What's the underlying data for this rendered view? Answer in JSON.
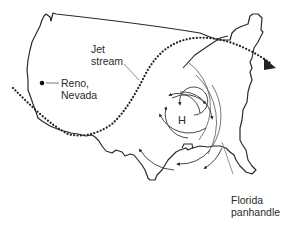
{
  "labels": {
    "jet_stream_line1": "Jet",
    "jet_stream_line2": "stream",
    "reno_line1": "Reno,",
    "reno_line2": "Nevada",
    "high_pressure": "H",
    "florida_line1": "Florida",
    "florida_line2": "panhandle"
  },
  "colors": {
    "outline": "#2a2a2a",
    "leader_line": "#777777",
    "background": "#ffffff"
  }
}
